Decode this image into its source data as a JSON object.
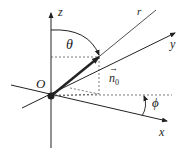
{
  "diagram": {
    "type": "spherical-coordinates",
    "labels": {
      "z_axis": "z",
      "x_axis": "x",
      "y_axis": "y",
      "r_line": "r",
      "origin": "O",
      "theta": "θ",
      "phi": "ϕ",
      "unit_vector": "n",
      "unit_vector_sub": "0",
      "unit_vector_arrow": "→"
    },
    "colors": {
      "line": "#222222",
      "dashed": "#444444",
      "background": "#ffffff"
    }
  }
}
